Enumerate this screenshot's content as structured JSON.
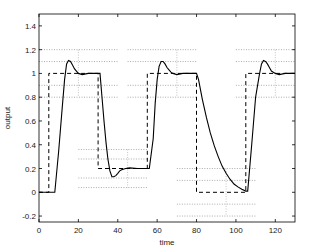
{
  "chart_data": {
    "type": "line",
    "title": "",
    "xlabel": "time",
    "ylabel": "output",
    "xlim": [
      0,
      130
    ],
    "ylim": [
      -0.25,
      1.5
    ],
    "xticks": [
      0,
      20,
      40,
      60,
      80,
      100,
      120
    ],
    "yticks": [
      -0.2,
      0,
      0.2,
      0.4,
      0.6,
      0.8,
      1,
      1.2,
      1.4
    ],
    "ytick_labels": [
      "-0.2",
      "0",
      "0.2",
      "0.4",
      "0.6",
      "0.8",
      "1",
      "1.2",
      "1.4"
    ],
    "grid": false,
    "legend": null,
    "series": [
      {
        "name": "setpoint",
        "style": "dashed",
        "color": "#000000",
        "x": [
          0,
          5,
          5,
          30,
          30,
          55,
          55,
          80,
          80,
          105,
          105,
          130
        ],
        "y": [
          0,
          0,
          1,
          1,
          0.2,
          0.2,
          1,
          1,
          0,
          0,
          1,
          1
        ]
      },
      {
        "name": "output",
        "style": "solid",
        "color": "#000000",
        "x": [
          0,
          8,
          10,
          12,
          13,
          14,
          15,
          16,
          17,
          18,
          19,
          20,
          22,
          25,
          30,
          31,
          32,
          33,
          34,
          35,
          36,
          37,
          38,
          39,
          40,
          41,
          42,
          44,
          46,
          50,
          56,
          58,
          59,
          60,
          61,
          62,
          63,
          64,
          65,
          66,
          67,
          68,
          70,
          73,
          80,
          81,
          83,
          85,
          87,
          89,
          91,
          93,
          95,
          97,
          99,
          101,
          103,
          105,
          106,
          108,
          110,
          112,
          113,
          114,
          115,
          116,
          117,
          118,
          119,
          120,
          122,
          125,
          130
        ],
        "y": [
          0,
          0,
          0.35,
          0.75,
          0.95,
          1.08,
          1.11,
          1.1,
          1.07,
          1.04,
          1.02,
          1.0,
          0.99,
          1.0,
          1.0,
          1.0,
          0.8,
          0.6,
          0.42,
          0.28,
          0.18,
          0.13,
          0.13,
          0.14,
          0.16,
          0.18,
          0.19,
          0.2,
          0.205,
          0.2,
          0.2,
          0.45,
          0.75,
          0.95,
          1.06,
          1.1,
          1.1,
          1.08,
          1.05,
          1.03,
          1.01,
          1.0,
          0.99,
          1.0,
          1.0,
          0.95,
          0.78,
          0.63,
          0.5,
          0.39,
          0.3,
          0.22,
          0.16,
          0.11,
          0.07,
          0.045,
          0.025,
          0.01,
          0.01,
          0.4,
          0.8,
          1.0,
          1.08,
          1.11,
          1.1,
          1.08,
          1.05,
          1.02,
          1.01,
          1.0,
          0.99,
          1.0,
          1.0
        ]
      }
    ],
    "reference_bands": [
      {
        "x": [
          0,
          40
        ],
        "y_lines": [
          1.2,
          1.1,
          0.9,
          0.8
        ],
        "x_marker": 20
      },
      {
        "x": [
          20,
          55
        ],
        "y_lines": [
          0.36,
          0.28,
          0.12,
          0.04
        ],
        "x_marker": 45
      },
      {
        "x": [
          45,
          80
        ],
        "y_lines": [
          1.2,
          1.1,
          0.9,
          0.8
        ],
        "x_marker": 70
      },
      {
        "x": [
          70,
          110
        ],
        "y_lines": [
          0.2,
          0.1,
          -0.1,
          -0.2
        ],
        "x_marker": 95
      },
      {
        "x": [
          100,
          130
        ],
        "y_lines": [
          1.2,
          1.1,
          0.9,
          0.8
        ],
        "x_marker": 120
      }
    ]
  }
}
